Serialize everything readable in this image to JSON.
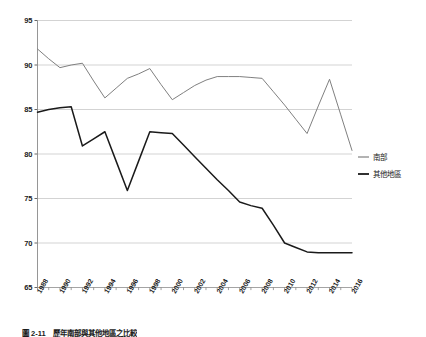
{
  "chart_data": {
    "type": "line",
    "title": "",
    "xlabel": "",
    "ylabel": "",
    "ylim": [
      65,
      95
    ],
    "yticks": [
      65,
      70,
      75,
      80,
      85,
      90,
      95
    ],
    "grid": true,
    "legend_position": "right",
    "x": [
      1988,
      1989,
      1990,
      1991,
      1992,
      1993,
      1994,
      1995,
      1996,
      1997,
      1998,
      1999,
      2000,
      2001,
      2002,
      2003,
      2004,
      2005,
      2006,
      2007,
      2008,
      2009,
      2010,
      2011,
      2012,
      2013,
      2014,
      2015,
      2016
    ],
    "xtick_labels": [
      "1988",
      "1990",
      "1992",
      "1994",
      "1996",
      "1998",
      "2000",
      "2002",
      "2004",
      "2006",
      "2008",
      "2010",
      "2012",
      "2014",
      "2016"
    ],
    "series": [
      {
        "name": "南部",
        "color": "#808080",
        "values": [
          91.8,
          90.7,
          89.7,
          90.0,
          90.2,
          88.2,
          86.3,
          87.4,
          88.5,
          89.0,
          89.6,
          87.8,
          86.1,
          86.9,
          87.7,
          88.3,
          88.7,
          88.7,
          88.7,
          88.6,
          88.5,
          87.0,
          85.5,
          83.9,
          82.3,
          85.4,
          88.4,
          84.4,
          80.4
        ]
      },
      {
        "name": "其他地區",
        "color": "#1a1a1a",
        "values": [
          84.7,
          85.0,
          85.2,
          85.3,
          80.9,
          81.7,
          82.5,
          79.2,
          75.9,
          79.2,
          82.5,
          82.4,
          82.3,
          81.0,
          79.7,
          78.4,
          77.1,
          75.9,
          74.6,
          74.2,
          73.9,
          72.0,
          70.0,
          69.5,
          69.0,
          68.9,
          68.9,
          68.9,
          68.9
        ]
      }
    ]
  },
  "legend": {
    "items": [
      {
        "label": "南部",
        "color": "#808080"
      },
      {
        "label": "其他地區",
        "color": "#1a1a1a"
      }
    ]
  },
  "caption": {
    "text": "圖 2-11　歷年南部與其他地區之比較"
  }
}
